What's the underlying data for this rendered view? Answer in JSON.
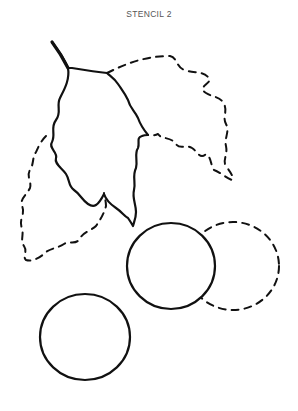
{
  "title": "STENCIL 2",
  "colors": {
    "background": "#ffffff",
    "line": "#111111",
    "title": "#555555"
  },
  "shapes": [
    {
      "name": "leaf-main",
      "style": "solid"
    },
    {
      "name": "leaf-right",
      "style": "dashed"
    },
    {
      "name": "leaf-left",
      "style": "dashed"
    },
    {
      "name": "berry-center",
      "style": "solid"
    },
    {
      "name": "berry-right",
      "style": "dashed"
    },
    {
      "name": "berry-lower",
      "style": "solid"
    }
  ]
}
